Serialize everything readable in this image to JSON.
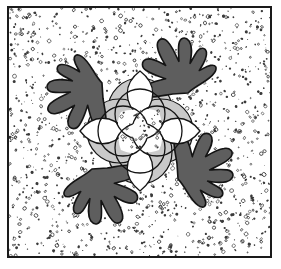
{
  "artwork": {
    "title": "Symmetrical Floral Medallion Block",
    "description": "Four-fold symmetric quilt block: a central rosette medallion of overlapping circles with four pointed white petals, surrounded by four dark oak-leaf shapes on a speckled background, enclosed in a thin rectangular frame.",
    "width": 281,
    "height": 269,
    "style": "line-art-halftone"
  },
  "colors": {
    "page_background": "#ffffff",
    "frame_stroke": "#1a1a1a",
    "panel_background": "#ffffff",
    "speckle_dot": "#3a3a3a",
    "leaf_fill": "#5e5e5e",
    "leaf_stroke": "#141414",
    "outer_circle_fill": "#c9c9c9",
    "outer_circle_stroke": "#141414",
    "inner_circle_stroke": "#141414",
    "petal_fill": "#ffffff",
    "petal_stroke": "#141414",
    "center_star_fill": "#fdfdfd"
  },
  "frame": {
    "label": "outer-frame",
    "x": 7,
    "y": 6,
    "width": 265,
    "height": 252,
    "stroke_width": 2
  },
  "panel": {
    "label": "speckled-panel",
    "x": 9,
    "y": 8,
    "width": 261,
    "height": 248
  },
  "medallion": {
    "label": "central-rosette",
    "center_x": 140,
    "center_y": 131,
    "outer_circle_radius": 32,
    "outer_circle_offset": 21,
    "inner_circle_radius": 25,
    "inner_circle_offset": 17,
    "petal_length": 46,
    "petal_width": 17
  },
  "petals": [
    {
      "name": "petal-north",
      "direction": "north",
      "angle": 270
    },
    {
      "name": "petal-east",
      "direction": "east",
      "angle": 0
    },
    {
      "name": "petal-south",
      "direction": "south",
      "angle": 90
    },
    {
      "name": "petal-west",
      "direction": "west",
      "angle": 180
    }
  ],
  "leaves": [
    {
      "name": "leaf-top-left",
      "corner": "top-left",
      "rotation": 0
    },
    {
      "name": "leaf-top-right",
      "corner": "top-right",
      "rotation": 90
    },
    {
      "name": "leaf-bottom-right",
      "corner": "bottom-right",
      "rotation": 180
    },
    {
      "name": "leaf-bottom-left",
      "corner": "bottom-left",
      "rotation": 270
    }
  ],
  "texture": {
    "label": "speckle-texture",
    "dot_count": 1450,
    "dot_min_radius": 0.5,
    "dot_max_radius": 1.9,
    "ring_ratio": 0.42
  }
}
